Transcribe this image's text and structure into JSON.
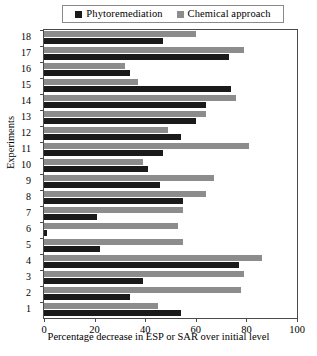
{
  "chart_data": {
    "type": "bar",
    "orientation": "horizontal",
    "title": "",
    "xlabel": "Percentage decrease in ESP or SAR over initial level",
    "ylabel": "Experiments",
    "xlim": [
      0,
      100
    ],
    "xticks": [
      0,
      20,
      40,
      60,
      80,
      100
    ],
    "grid": false,
    "legend_position": "top-center",
    "categories": [
      "1",
      "2",
      "3",
      "4",
      "5",
      "6",
      "7",
      "8",
      "9",
      "10",
      "11",
      "12",
      "13",
      "14",
      "15",
      "16",
      "17",
      "18"
    ],
    "series": [
      {
        "name": "Phytoremediation",
        "color": "#1a1a1a",
        "values": [
          54,
          34,
          39,
          77,
          22,
          1,
          21,
          55,
          46,
          41,
          47,
          54,
          60,
          64,
          74,
          34,
          73,
          47
        ]
      },
      {
        "name": "Chemical approach",
        "color": "#8c8c8c",
        "values": [
          45,
          78,
          79,
          86,
          55,
          53,
          55,
          64,
          67,
          39,
          81,
          49,
          64,
          76,
          37,
          32,
          79,
          60
        ]
      }
    ]
  },
  "legend": {
    "entries": [
      {
        "label": "Phytoremediation"
      },
      {
        "label": "Chemical approach"
      }
    ]
  },
  "axes": {
    "x_title": "Percentage decrease in ESP or SAR over initial level",
    "y_title": "Experiments",
    "x_tick_labels": [
      "0",
      "20",
      "40",
      "60",
      "80",
      "100"
    ],
    "y_tick_labels": [
      "18",
      "17",
      "16",
      "15",
      "14",
      "13",
      "12",
      "11",
      "10",
      "9",
      "8",
      "7",
      "6",
      "5",
      "4",
      "3",
      "2",
      "1"
    ]
  },
  "colors": {
    "phytoremediation": "#1a1a1a",
    "chemical_approach": "#8c8c8c",
    "frame": "#4a4a4a",
    "background": "#ffffff"
  }
}
